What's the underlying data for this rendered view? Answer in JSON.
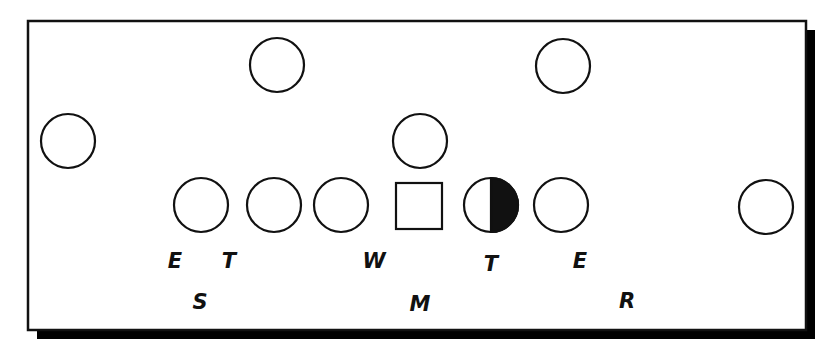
{
  "diagram": {
    "colors": {
      "stroke": "#111111",
      "fill": "#ffffff",
      "shadow": "#000000"
    },
    "frame": {
      "x": 28,
      "y": 21,
      "w": 778,
      "h": 309,
      "shadow_offset": 9
    },
    "offense": [
      {
        "id": "wr-left",
        "shape": "circle",
        "cx": 68,
        "cy": 141
      },
      {
        "id": "lt",
        "shape": "circle",
        "cx": 201,
        "cy": 205
      },
      {
        "id": "lg",
        "shape": "circle",
        "cx": 274,
        "cy": 205
      },
      {
        "id": "rg-left",
        "shape": "circle",
        "cx": 341,
        "cy": 205
      },
      {
        "id": "center",
        "shape": "square",
        "cx": 419,
        "cy": 206
      },
      {
        "id": "rg",
        "shape": "half-circle",
        "cx": 491,
        "cy": 205
      },
      {
        "id": "rt",
        "shape": "circle",
        "cx": 561,
        "cy": 205
      },
      {
        "id": "wr-right",
        "shape": "circle",
        "cx": 766,
        "cy": 207
      },
      {
        "id": "back-left",
        "shape": "circle",
        "cx": 277,
        "cy": 65
      },
      {
        "id": "back-right",
        "shape": "circle",
        "cx": 563,
        "cy": 66
      },
      {
        "id": "qb",
        "shape": "circle",
        "cx": 420,
        "cy": 141
      }
    ],
    "labels": [
      {
        "text": "E",
        "x": 175,
        "y": 268
      },
      {
        "text": "T",
        "x": 229,
        "y": 268
      },
      {
        "text": "W",
        "x": 374,
        "y": 268
      },
      {
        "text": "T",
        "x": 491,
        "y": 271
      },
      {
        "text": "E",
        "x": 580,
        "y": 268
      },
      {
        "text": "S",
        "x": 200,
        "y": 309
      },
      {
        "text": "M",
        "x": 420,
        "y": 311
      },
      {
        "text": "R",
        "x": 627,
        "y": 308
      }
    ]
  }
}
